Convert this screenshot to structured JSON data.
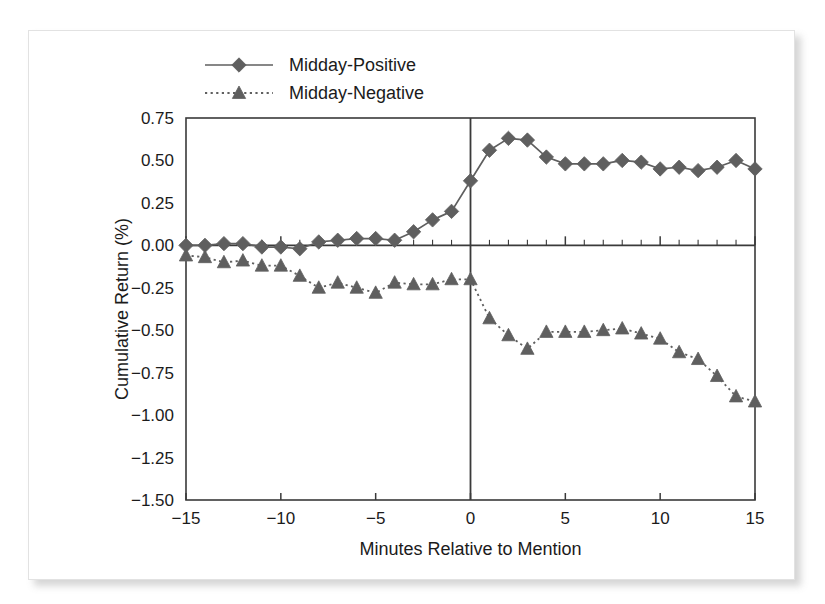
{
  "chart_data": {
    "type": "line",
    "title": "",
    "xlabel": "Minutes Relative to Mention",
    "ylabel": "Cumulative Return (%)",
    "xlim": [
      -15,
      15
    ],
    "ylim": [
      -1.5,
      0.75
    ],
    "xticks": [
      -15,
      -10,
      -5,
      0,
      5,
      10,
      15
    ],
    "xtick_labels": [
      "−15",
      "−10",
      "−5",
      "0",
      "5",
      "10",
      "15"
    ],
    "yticks": [
      0.75,
      0.5,
      0.25,
      0.0,
      -0.25,
      -0.5,
      -0.75,
      -1.0,
      -1.25,
      -1.5
    ],
    "ytick_labels": [
      "0.75",
      "0.50",
      "0.25",
      "0.00",
      "−0.25",
      "−0.50",
      "−0.75",
      "−1.00",
      "−1.25",
      "−1.50"
    ],
    "grid": false,
    "minor_xticks_every": 1,
    "zero_line_y": 0.0,
    "zero_line_x": 0,
    "legend_position": "top-center",
    "x": [
      -15,
      -14,
      -13,
      -12,
      -11,
      -10,
      -9,
      -8,
      -7,
      -6,
      -5,
      -4,
      -3,
      -2,
      -1,
      0,
      1,
      2,
      3,
      4,
      5,
      6,
      7,
      8,
      9,
      10,
      11,
      12,
      13,
      14,
      15
    ],
    "series": [
      {
        "name": "Midday-Positive",
        "marker": "diamond",
        "linestyle": "solid",
        "color": "#5f5f5f",
        "values": [
          0.0,
          0.0,
          0.01,
          0.01,
          -0.01,
          -0.01,
          -0.02,
          0.02,
          0.03,
          0.04,
          0.04,
          0.03,
          0.08,
          0.15,
          0.2,
          0.38,
          0.56,
          0.63,
          0.62,
          0.52,
          0.48,
          0.48,
          0.48,
          0.5,
          0.49,
          0.45,
          0.46,
          0.44,
          0.46,
          0.5,
          0.45
        ]
      },
      {
        "name": "Midday-Negative",
        "marker": "triangle",
        "linestyle": "dotted",
        "color": "#5f5f5f",
        "values": [
          -0.06,
          -0.07,
          -0.1,
          -0.09,
          -0.12,
          -0.12,
          -0.18,
          -0.25,
          -0.22,
          -0.25,
          -0.28,
          -0.22,
          -0.23,
          -0.23,
          -0.2,
          -0.2,
          -0.43,
          -0.53,
          -0.61,
          -0.51,
          -0.51,
          -0.51,
          -0.5,
          -0.49,
          -0.52,
          -0.55,
          -0.63,
          -0.67,
          -0.77,
          -0.89,
          -0.92
        ]
      }
    ]
  },
  "legend": {
    "entries": [
      {
        "label": "Midday-Positive"
      },
      {
        "label": "Midday-Negative"
      }
    ]
  },
  "axes": {
    "x_title": "Minutes Relative to Mention",
    "y_title": "Cumulative Return (%)"
  },
  "colors": {
    "series": "#5f5f5f",
    "axis": "#3a3a3a",
    "text": "#1b1b1b",
    "panel_background": "#ffffff",
    "page_background": "#ffffff"
  }
}
